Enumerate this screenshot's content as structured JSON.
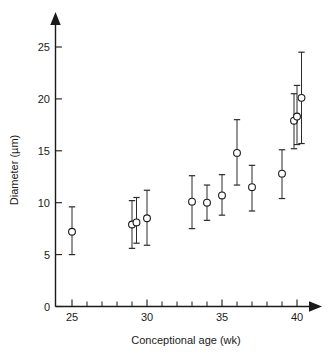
{
  "chart_data": {
    "type": "scatter",
    "title": "",
    "xlabel": "Conceptional age (wk)",
    "ylabel": "Diameter (µm)",
    "xlim": [
      23.6,
      41.6
    ],
    "ylim": [
      0,
      27.3
    ],
    "grid": false,
    "legend": null,
    "x_ticks_labeled": [
      25,
      30,
      35,
      40
    ],
    "x_tick_labels": [
      "25",
      "30",
      "35",
      "40"
    ],
    "x_ticks_all": [
      25,
      26,
      27,
      28,
      29,
      30,
      31,
      32,
      33,
      34,
      35,
      36,
      37,
      38,
      39,
      40
    ],
    "y_ticks": [
      0,
      5,
      10,
      15,
      20,
      25
    ],
    "y_tick_labels": [
      "0",
      "5",
      "10",
      "15",
      "20",
      "25"
    ],
    "error_type": "error bars (range)",
    "marker": "open circle",
    "points": [
      {
        "x": 25.0,
        "y": 7.2,
        "lo": 5.0,
        "hi": 9.6
      },
      {
        "x": 29.0,
        "y": 7.9,
        "lo": 5.6,
        "hi": 10.2
      },
      {
        "x": 29.3,
        "y": 8.1,
        "lo": 6.1,
        "hi": 10.5
      },
      {
        "x": 30.0,
        "y": 8.5,
        "lo": 5.9,
        "hi": 11.2
      },
      {
        "x": 33.0,
        "y": 10.1,
        "lo": 7.5,
        "hi": 12.6
      },
      {
        "x": 34.0,
        "y": 10.0,
        "lo": 8.3,
        "hi": 11.7
      },
      {
        "x": 35.0,
        "y": 10.7,
        "lo": 8.8,
        "hi": 12.7
      },
      {
        "x": 36.0,
        "y": 14.8,
        "lo": 11.7,
        "hi": 18.0
      },
      {
        "x": 37.0,
        "y": 11.5,
        "lo": 9.2,
        "hi": 13.6
      },
      {
        "x": 39.0,
        "y": 12.8,
        "lo": 10.4,
        "hi": 15.1
      },
      {
        "x": 39.8,
        "y": 17.9,
        "lo": 15.2,
        "hi": 20.5
      },
      {
        "x": 40.0,
        "y": 18.3,
        "lo": 15.6,
        "hi": 21.3
      },
      {
        "x": 40.3,
        "y": 20.1,
        "lo": 15.7,
        "hi": 24.5
      }
    ]
  },
  "figure": {
    "background_color": "#ffffff",
    "ink_color": "#1a1a1a",
    "marker_fill": "#ffffff"
  }
}
